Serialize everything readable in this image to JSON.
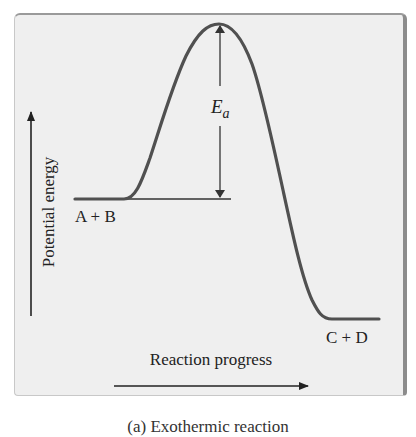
{
  "figure": {
    "type": "energy-profile",
    "y_axis_label": "Potential energy",
    "x_axis_label": "Reaction progress",
    "reactants_label": "A + B",
    "products_label": "C + D",
    "activation_energy_label": {
      "main": "E",
      "subscript": "a"
    },
    "caption_partial": "(a) Exothermic reaction"
  },
  "colors": {
    "page_background": "#ffffff",
    "panel_background": "#efefef",
    "curve": "#505050",
    "arrows": "#222222",
    "text": "#222222"
  }
}
